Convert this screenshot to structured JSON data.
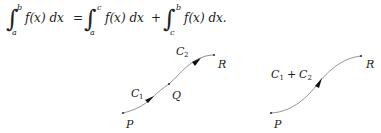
{
  "equation": {
    "integral1": {
      "lower": "a",
      "upper": "b",
      "integrand": "f(x) dx"
    },
    "equals": "=",
    "integral2": {
      "lower": "a",
      "upper": "c",
      "integrand": "f(x) dx"
    },
    "plus": "+",
    "integral3": {
      "lower": "c",
      "upper": "b",
      "integrand": "f(x) dx."
    }
  },
  "left_diagram": {
    "points": {
      "P": "P",
      "Q": "Q",
      "R": "R"
    },
    "curve_labels": {
      "C1": "C",
      "C1_sub": "1",
      "C2": "C",
      "C2_sub": "2"
    }
  },
  "right_diagram": {
    "points": {
      "P": "P",
      "R": "R"
    },
    "curve_label": {
      "C": "C",
      "sub1": "1",
      "plus": "+",
      "C2": "C",
      "sub2": "2"
    }
  }
}
